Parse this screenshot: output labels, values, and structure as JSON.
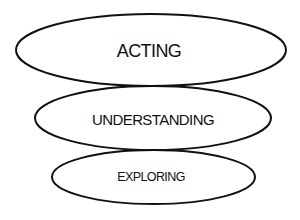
{
  "diagram": {
    "type": "stacked-ellipses",
    "background": "#ffffff",
    "stroke_color": "#111111",
    "nodes": [
      {
        "id": "acting",
        "label": "ACTING",
        "level": 3,
        "position": "top"
      },
      {
        "id": "understanding",
        "label": "UNDERSTANDING",
        "level": 2,
        "position": "middle"
      },
      {
        "id": "exploring",
        "label": "EXPLORING",
        "level": 1,
        "position": "bottom"
      }
    ],
    "edges": [
      {
        "from": "exploring",
        "to": "understanding",
        "relation": "touching"
      },
      {
        "from": "understanding",
        "to": "acting",
        "relation": "touching"
      }
    ]
  }
}
